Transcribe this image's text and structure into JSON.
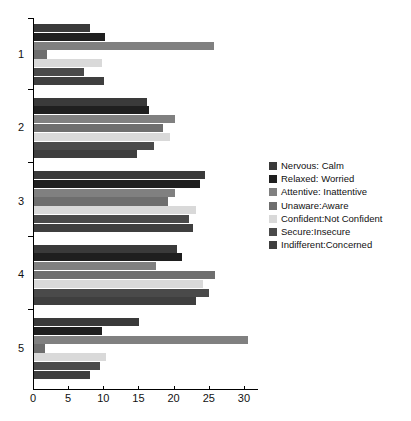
{
  "chart_data": {
    "type": "bar",
    "orientation": "horizontal",
    "title": "",
    "xlabel": "",
    "ylabel": "",
    "categories": [
      "1",
      "2",
      "3",
      "4",
      "5"
    ],
    "xlim": [
      0,
      32
    ],
    "xticks": [
      0,
      5,
      10,
      15,
      20,
      25,
      30
    ],
    "xtick_labels": [
      "0",
      "5",
      "10",
      "15",
      "20",
      "25",
      "30"
    ],
    "grid": false,
    "legend_position": "right",
    "series": [
      {
        "name": "Nervous: Calm",
        "color": "#3a3a3a",
        "values": [
          8.0,
          16.0,
          24.3,
          20.3,
          14.9
        ]
      },
      {
        "name": "Relaxed: Worried",
        "color": "#1f1f1f",
        "values": [
          10.1,
          16.4,
          23.6,
          21.0,
          9.6
        ]
      },
      {
        "name": "Attentive: Inattentive",
        "color": "#808080",
        "values": [
          25.6,
          20.0,
          20.0,
          17.4,
          30.4
        ]
      },
      {
        "name": "Unaware:Aware",
        "color": "#6e6e6e",
        "values": [
          1.9,
          18.4,
          19.1,
          25.7,
          1.6
        ]
      },
      {
        "name": "Confident:Not Confident",
        "color": "#d9d9d9",
        "values": [
          9.7,
          19.4,
          23.1,
          24.0,
          10.3
        ]
      },
      {
        "name": "Secure:Insecure",
        "color": "#4a4a4a",
        "values": [
          7.1,
          17.1,
          22.0,
          24.9,
          9.4
        ]
      },
      {
        "name": "Indifferent:Concerned",
        "color": "#3f3f3f",
        "values": [
          9.9,
          14.7,
          22.6,
          23.1,
          7.9
        ]
      }
    ]
  }
}
